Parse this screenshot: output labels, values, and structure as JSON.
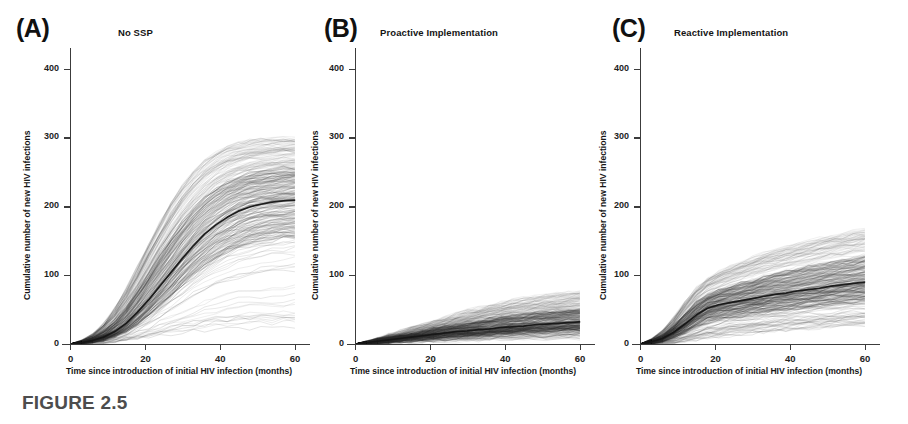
{
  "figure": {
    "caption": "FIGURE 2.5"
  },
  "chart_data": [
    {
      "type": "line",
      "panel_letter": "(A)",
      "title": "No SSP",
      "xlabel": "Time since introduction of initial HIV infection (months)",
      "ylabel": "Cumulative number of new HIV infections",
      "xlim": [
        0,
        62
      ],
      "ylim": [
        0,
        430
      ],
      "xticks": [
        0,
        20,
        40,
        60
      ],
      "xtick_labels": [
        "0",
        "20",
        "40",
        "60"
      ],
      "yticks": [
        0,
        100,
        200,
        300,
        400
      ],
      "ytick_labels": [
        "0",
        "100",
        "200",
        "300",
        "400"
      ],
      "grid": false,
      "legend": "none",
      "description": "Ensemble of stochastic simulation trajectories (thin translucent grey lines) with the median trajectory drawn as a thick dark line.",
      "x": [
        0,
        3,
        6,
        9,
        12,
        15,
        18,
        21,
        24,
        27,
        30,
        33,
        36,
        39,
        42,
        45,
        48,
        51,
        54,
        57,
        60
      ],
      "series": [
        {
          "name": "Median cumulative infections",
          "style": "thick-dark",
          "values": [
            0,
            2,
            5,
            10,
            18,
            30,
            46,
            64,
            84,
            104,
            124,
            143,
            160,
            173,
            184,
            193,
            199,
            203,
            206,
            208,
            209
          ]
        },
        {
          "name": "95th percentile envelope",
          "style": "thin-grey",
          "values": [
            0,
            5,
            14,
            30,
            52,
            80,
            112,
            146,
            178,
            207,
            232,
            252,
            268,
            280,
            288,
            293,
            296,
            298,
            299,
            300,
            300
          ]
        },
        {
          "name": "75th percentile envelope",
          "style": "thin-grey",
          "values": [
            0,
            3,
            9,
            19,
            34,
            54,
            78,
            104,
            130,
            155,
            178,
            198,
            214,
            227,
            237,
            244,
            249,
            252,
            254,
            256,
            257
          ]
        },
        {
          "name": "25th percentile envelope",
          "style": "thin-grey",
          "values": [
            0,
            1,
            3,
            6,
            11,
            18,
            28,
            40,
            54,
            68,
            83,
            97,
            110,
            121,
            130,
            137,
            143,
            147,
            150,
            152,
            153
          ]
        },
        {
          "name": "5th percentile envelope",
          "style": "thin-grey",
          "values": [
            0,
            0,
            1,
            2,
            3,
            5,
            7,
            9,
            11,
            13,
            14,
            15,
            16,
            17,
            17,
            18,
            18,
            18,
            18,
            19,
            19
          ]
        }
      ]
    },
    {
      "type": "line",
      "panel_letter": "(B)",
      "title": "Proactive Implementation",
      "xlabel": "Time since introduction of initial HIV infection (months)",
      "ylabel": "Cumulative number of new HIV infections",
      "xlim": [
        0,
        62
      ],
      "ylim": [
        0,
        430
      ],
      "xticks": [
        0,
        20,
        40,
        60
      ],
      "xtick_labels": [
        "0",
        "20",
        "40",
        "60"
      ],
      "yticks": [
        0,
        100,
        200,
        300,
        400
      ],
      "ytick_labels": [
        "0",
        "100",
        "200",
        "300",
        "400"
      ],
      "grid": false,
      "legend": "none",
      "description": "Ensemble of stochastic simulation trajectories under proactive syringe services program implementation; outbreak is strongly suppressed.",
      "x": [
        0,
        3,
        6,
        9,
        12,
        15,
        18,
        21,
        24,
        27,
        30,
        33,
        36,
        39,
        42,
        45,
        48,
        51,
        54,
        57,
        60
      ],
      "series": [
        {
          "name": "Median cumulative infections",
          "style": "thick-dark",
          "values": [
            0,
            2,
            4,
            6,
            8,
            10,
            12,
            14,
            16,
            18,
            19,
            21,
            22,
            24,
            25,
            26,
            28,
            29,
            30,
            31,
            32
          ]
        },
        {
          "name": "95th percentile envelope",
          "style": "thin-grey",
          "values": [
            0,
            4,
            8,
            13,
            18,
            23,
            28,
            33,
            38,
            43,
            48,
            52,
            56,
            60,
            63,
            66,
            69,
            71,
            73,
            75,
            77
          ]
        },
        {
          "name": "75th percentile envelope",
          "style": "thin-grey",
          "values": [
            0,
            3,
            6,
            9,
            12,
            15,
            18,
            22,
            25,
            28,
            31,
            34,
            37,
            39,
            41,
            43,
            45,
            47,
            48,
            50,
            51
          ]
        },
        {
          "name": "25th percentile envelope",
          "style": "thin-grey",
          "values": [
            0,
            1,
            2,
            4,
            5,
            6,
            8,
            9,
            10,
            11,
            12,
            13,
            14,
            15,
            16,
            17,
            18,
            18,
            19,
            20,
            20
          ]
        },
        {
          "name": "5th percentile envelope",
          "style": "thin-grey",
          "values": [
            0,
            0,
            1,
            1,
            2,
            2,
            3,
            3,
            4,
            4,
            5,
            5,
            6,
            6,
            6,
            7,
            7,
            7,
            8,
            8,
            8
          ]
        }
      ]
    },
    {
      "type": "line",
      "panel_letter": "(C)",
      "title": "Reactive Implementation",
      "xlabel": "Time since introduction of initial HIV infection (months)",
      "ylabel": "Cumulative number of new HIV infections",
      "xlim": [
        0,
        62
      ],
      "ylim": [
        0,
        430
      ],
      "xticks": [
        0,
        20,
        40,
        60
      ],
      "xtick_labels": [
        "0",
        "20",
        "40",
        "60"
      ],
      "yticks": [
        0,
        100,
        200,
        300,
        400
      ],
      "ytick_labels": [
        "0",
        "100",
        "200",
        "300",
        "400"
      ],
      "grid": false,
      "legend": "none",
      "description": "Ensemble of stochastic simulation trajectories under reactive syringe services program implementation; rapid early growth followed by a marked slowing after the program begins around month 18.",
      "x": [
        0,
        3,
        6,
        9,
        12,
        15,
        18,
        21,
        24,
        27,
        30,
        33,
        36,
        39,
        42,
        45,
        48,
        51,
        54,
        57,
        60
      ],
      "series": [
        {
          "name": "Median cumulative infections",
          "style": "thick-dark",
          "values": [
            0,
            3,
            8,
            17,
            29,
            42,
            52,
            57,
            60,
            63,
            66,
            69,
            72,
            74,
            77,
            79,
            81,
            84,
            86,
            88,
            90
          ]
        },
        {
          "name": "95th percentile envelope",
          "style": "thin-grey",
          "values": [
            0,
            7,
            19,
            38,
            60,
            80,
            95,
            105,
            112,
            119,
            125,
            131,
            136,
            141,
            145,
            149,
            153,
            157,
            160,
            163,
            166
          ]
        },
        {
          "name": "75th percentile envelope",
          "style": "thin-grey",
          "values": [
            0,
            5,
            13,
            27,
            44,
            60,
            71,
            78,
            83,
            88,
            92,
            97,
            101,
            105,
            108,
            112,
            115,
            118,
            121,
            124,
            127
          ]
        },
        {
          "name": "25th percentile envelope",
          "style": "thin-grey",
          "values": [
            0,
            1,
            4,
            9,
            16,
            24,
            31,
            35,
            38,
            40,
            42,
            44,
            46,
            48,
            50,
            52,
            54,
            55,
            57,
            59,
            60
          ]
        },
        {
          "name": "5th percentile envelope",
          "style": "thin-grey",
          "values": [
            0,
            0,
            1,
            2,
            4,
            6,
            8,
            10,
            12,
            13,
            15,
            16,
            18,
            19,
            20,
            21,
            22,
            23,
            24,
            25,
            26
          ]
        }
      ]
    }
  ]
}
